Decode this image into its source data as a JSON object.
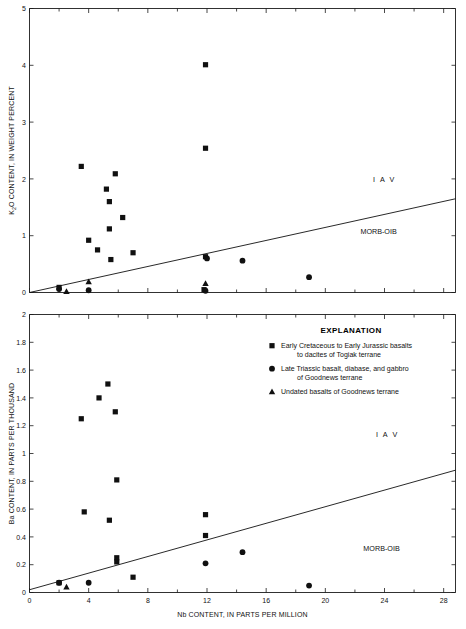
{
  "chart_data": [
    {
      "id": "k2o_panel",
      "type": "scatter",
      "title": "",
      "xlabel": "",
      "ylabel": "K2O CONTENT, IN WEIGHT PERCENT",
      "ylabel_display": "K₂O CONTENT, IN WEIGHT PERCENT",
      "xlim": [
        0,
        28.8
      ],
      "ylim": [
        0,
        5
      ],
      "xticks_major": [
        0,
        4,
        8,
        12,
        16,
        20,
        24,
        28
      ],
      "xticks_minor": [
        2,
        6,
        10,
        14,
        18,
        22,
        26
      ],
      "xtick_labels": [
        "",
        "",
        "",
        "",
        "",
        "",
        "",
        ""
      ],
      "yticks": [
        0,
        1,
        2,
        3,
        4,
        5
      ],
      "ytick_labels": [
        "0",
        "1",
        "2",
        "3",
        "4",
        "5"
      ],
      "grid": false,
      "trendline": {
        "name": "IAV / MORB-OIB divide",
        "x0": 0,
        "y0": 0,
        "x1": 28.8,
        "y1": 1.65
      },
      "annotations": [
        {
          "text": "I A V",
          "x": 24.0,
          "y": 1.95
        },
        {
          "text": "MORB-OIB",
          "x": 23.6,
          "y": 1.03
        }
      ],
      "series": [
        {
          "name": "Early Cretaceous to Early Jurassic basalts to dacites of Togiak terrane",
          "marker": "square",
          "points": [
            {
              "x": 3.5,
              "y": 2.22
            },
            {
              "x": 5.8,
              "y": 2.09
            },
            {
              "x": 5.2,
              "y": 1.82
            },
            {
              "x": 5.4,
              "y": 1.6
            },
            {
              "x": 6.3,
              "y": 1.32
            },
            {
              "x": 5.4,
              "y": 1.12
            },
            {
              "x": 4.0,
              "y": 0.92
            },
            {
              "x": 4.6,
              "y": 0.75
            },
            {
              "x": 5.5,
              "y": 0.58
            },
            {
              "x": 7.0,
              "y": 0.7
            },
            {
              "x": 11.9,
              "y": 4.01
            },
            {
              "x": 11.9,
              "y": 2.54
            },
            {
              "x": 11.9,
              "y": 0.63
            },
            {
              "x": 2.0,
              "y": 0.09
            },
            {
              "x": 11.8,
              "y": 0.05
            }
          ]
        },
        {
          "name": "Late Triassic basalt, diabase, and gabbro of Goodnews terrane",
          "marker": "circle",
          "points": [
            {
              "x": 14.4,
              "y": 0.56
            },
            {
              "x": 18.9,
              "y": 0.27
            },
            {
              "x": 12.0,
              "y": 0.6
            },
            {
              "x": 4.0,
              "y": 0.04
            },
            {
              "x": 11.9,
              "y": 0.03
            },
            {
              "x": 2.0,
              "y": 0.06
            }
          ]
        },
        {
          "name": "Undated basalts of Goodnews terrane",
          "marker": "triangle",
          "points": [
            {
              "x": 4.0,
              "y": 0.19
            },
            {
              "x": 11.9,
              "y": 0.16
            },
            {
              "x": 2.5,
              "y": 0.02
            }
          ]
        }
      ]
    },
    {
      "id": "ba_panel",
      "type": "scatter",
      "title": "",
      "xlabel": "Nb CONTENT, IN PARTS PER MILLION",
      "ylabel": "Ba CONTENT, IN PARTS PER THOUSAND",
      "ylabel_display": "Ba CONTENT, IN PARTS PER THOUSAND",
      "xlim": [
        0,
        28.8
      ],
      "ylim": [
        0,
        2
      ],
      "xticks_major": [
        0,
        4,
        8,
        12,
        16,
        20,
        24,
        28
      ],
      "xticks_minor": [
        2,
        6,
        10,
        14,
        18,
        22,
        26
      ],
      "xtick_labels": [
        "0",
        "4",
        "8",
        "12",
        "16",
        "20",
        "24",
        "28"
      ],
      "yticks": [
        0,
        0.2,
        0.4,
        0.6,
        0.8,
        1,
        1.2,
        1.4,
        1.6,
        1.8,
        2
      ],
      "ytick_labels": [
        "0",
        "0.2",
        "0.4",
        "0.6",
        "0.8",
        "1",
        "1.2",
        "1.4",
        "1.6",
        "1.8",
        "2"
      ],
      "grid": false,
      "trendline": {
        "name": "IAV / MORB-OIB divide",
        "x0": 0,
        "y0": 0.02,
        "x1": 28.8,
        "y1": 0.88
      },
      "annotations": [
        {
          "text": "I A V",
          "x": 24.2,
          "y": 1.12
        },
        {
          "text": "MORB-OIB",
          "x": 23.8,
          "y": 0.3
        }
      ],
      "series": [
        {
          "name": "Early Cretaceous to Early Jurassic basalts to dacites of Togiak terrane",
          "marker": "square",
          "points": [
            {
              "x": 5.3,
              "y": 1.5
            },
            {
              "x": 4.7,
              "y": 1.4
            },
            {
              "x": 5.8,
              "y": 1.3
            },
            {
              "x": 3.5,
              "y": 1.25
            },
            {
              "x": 5.9,
              "y": 0.81
            },
            {
              "x": 3.7,
              "y": 0.58
            },
            {
              "x": 5.4,
              "y": 0.52
            },
            {
              "x": 11.9,
              "y": 0.56
            },
            {
              "x": 11.9,
              "y": 0.41
            },
            {
              "x": 5.9,
              "y": 0.25
            },
            {
              "x": 5.9,
              "y": 0.22
            },
            {
              "x": 7.0,
              "y": 0.11
            },
            {
              "x": 2.0,
              "y": 0.07
            }
          ]
        },
        {
          "name": "Late Triassic basalt, diabase, and gabbro of Goodnews terrane",
          "marker": "circle",
          "points": [
            {
              "x": 14.4,
              "y": 0.29
            },
            {
              "x": 11.9,
              "y": 0.21
            },
            {
              "x": 18.9,
              "y": 0.05
            },
            {
              "x": 4.0,
              "y": 0.07
            },
            {
              "x": 2.0,
              "y": 0.07
            }
          ]
        },
        {
          "name": "Undated basalts of Goodnews terrane",
          "marker": "triangle",
          "points": [
            {
              "x": 2.5,
              "y": 0.04
            }
          ]
        }
      ]
    }
  ],
  "legend": {
    "title": "EXPLANATION",
    "entries": [
      {
        "marker": "square",
        "line1": "Early Cretaceous to Early Jurassic basalts",
        "line2": "to dacites of Togiak terrane"
      },
      {
        "marker": "circle",
        "line1": "Late Triassic basalt, diabase, and gabbro",
        "line2": "of Goodnews terrane"
      },
      {
        "marker": "triangle",
        "line1": "Undated basalts of Goodnews terrane",
        "line2": ""
      }
    ]
  },
  "colors": {
    "marker": "#101010",
    "axis": "#1a1a1a",
    "background": "#ffffff",
    "text": "#111111"
  }
}
